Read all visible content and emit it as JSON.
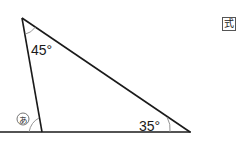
{
  "diagram": {
    "type": "triangle-angle-problem",
    "angles": {
      "top": "45°",
      "bottom_right": "35°",
      "unknown_label": "あ"
    },
    "badge": "式",
    "colors": {
      "line": "#1a1a1a",
      "arc": "#888888",
      "background": "#ffffff"
    }
  }
}
